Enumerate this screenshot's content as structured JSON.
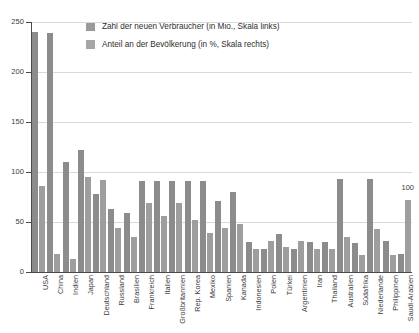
{
  "chart_data": {
    "type": "bar",
    "title": "",
    "xlabel": "",
    "ylabel": "",
    "grid": true,
    "legend_position": "top-left-inside",
    "ylim": [
      0,
      250
    ],
    "yticks": [
      0,
      50,
      100,
      150,
      200,
      250
    ],
    "right_axis_annotation": "100",
    "categories": [
      "USA",
      "China",
      "Indien",
      "Japan",
      "Deutschland",
      "Russland",
      "Brasilien",
      "Frankreich",
      "Italien",
      "Großbritannien",
      "Rep. Korea",
      "Mexiko",
      "Spanien",
      "Kanada",
      "Indonesien",
      "Polen",
      "Türkei",
      "Argentinien",
      "Iran",
      "Thailand",
      "Australien",
      "Südafrika",
      "Niederlande",
      "Philippinen",
      "Saudi-Arabien"
    ],
    "series": [
      {
        "name": "Zahl der neuen Verbraucher (in Mio., Skala links)",
        "color": "#8c8c8c",
        "unit": "Mio.",
        "axis": "left",
        "values": [
          240,
          239,
          110,
          122,
          78,
          63,
          59,
          91,
          91,
          91,
          91,
          91,
          71,
          80,
          30,
          23,
          38,
          23,
          30,
          30,
          93,
          29,
          93,
          31,
          18
        ]
      },
      {
        "name": "Anteil an der Bevölkerung (in %, Skala rechts)",
        "color": "#9e9e9e",
        "unit": "%",
        "axis": "right",
        "values": [
          86,
          18,
          13,
          95,
          92,
          44,
          35,
          69,
          56,
          69,
          52,
          39,
          44,
          48,
          23,
          31,
          25,
          31,
          23,
          23,
          35,
          17,
          43,
          17,
          72
        ]
      }
    ]
  },
  "legend": {
    "items": [
      {
        "label": "Zahl der neuen Verbraucher (in Mio., Skala links)"
      },
      {
        "label": "Anteil an der Bevölkerung (in %, Skala rechts)"
      }
    ]
  }
}
